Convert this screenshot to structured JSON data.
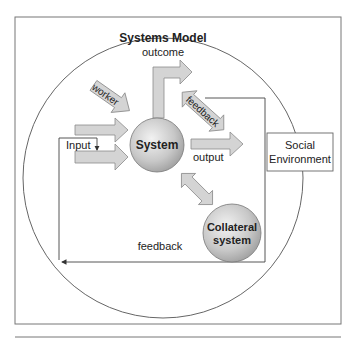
{
  "diagram": {
    "title": "Systems Model",
    "labels": {
      "outcome": "outcome",
      "worker": "worker",
      "feedback_diagonal": "feedback",
      "input": "Input",
      "output": "output",
      "feedback_bottom": "feedback"
    },
    "nodes": {
      "system": "System",
      "collateral_line1": "Collateral",
      "collateral_line2": "system",
      "social_line1": "Social",
      "social_line2": "Environment"
    },
    "colors": {
      "arrow_fill": "#d4d4d4",
      "arrow_stroke": "#8a8a8a",
      "sphere_light": "#eeeeee",
      "sphere_dark": "#9c9c9c",
      "line": "#555555"
    }
  }
}
